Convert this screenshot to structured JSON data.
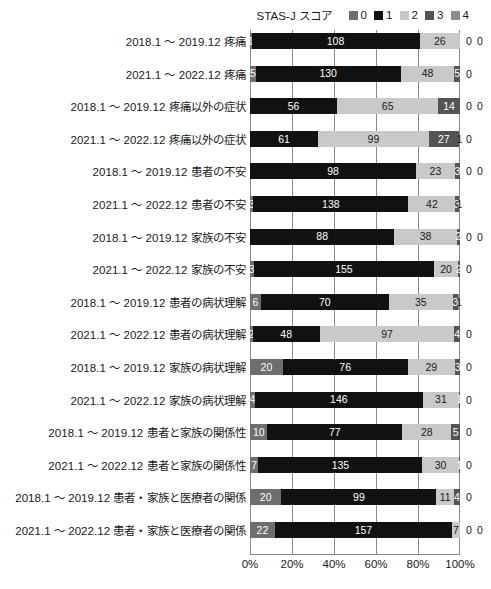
{
  "legend": {
    "title": "STAS-J スコア",
    "items": [
      {
        "label": "0",
        "color": "#6e6e6e"
      },
      {
        "label": "1",
        "color": "#111111"
      },
      {
        "label": "2",
        "color": "#c9c9c9"
      },
      {
        "label": "3",
        "color": "#545454"
      },
      {
        "label": "4",
        "color": "#8c8c8c"
      }
    ]
  },
  "xaxis": {
    "ticks": [
      "0%",
      "20%",
      "40%",
      "60%",
      "80%",
      "100%"
    ],
    "values": [
      0,
      20,
      40,
      60,
      80,
      100
    ]
  },
  "chart_data": {
    "type": "bar",
    "title": "",
    "subtitle": "",
    "xlabel": "",
    "ylabel": "",
    "orientation": "horizontal",
    "stacked": true,
    "normalized": true,
    "xlim": [
      0,
      100
    ],
    "grid": true,
    "legend_position": "top-right",
    "legend_title": "STAS-J スコア",
    "series": [
      {
        "name": "0",
        "color": "#6e6e6e",
        "values": [
          1,
          5,
          0,
          0,
          0,
          3,
          0,
          3,
          6,
          2,
          20,
          4,
          10,
          7,
          20,
          22
        ]
      },
      {
        "name": "1",
        "color": "#111111",
        "values": [
          108,
          130,
          56,
          61,
          98,
          138,
          88,
          155,
          70,
          48,
          76,
          146,
          77,
          135,
          99,
          157
        ]
      },
      {
        "name": "2",
        "color": "#c9c9c9",
        "values": [
          26,
          48,
          65,
          99,
          23,
          42,
          38,
          20,
          35,
          97,
          29,
          31,
          28,
          30,
          11,
          7
        ]
      },
      {
        "name": "3",
        "color": "#545454",
        "values": [
          0,
          5,
          14,
          27,
          3,
          3,
          2,
          2,
          3,
          4,
          3,
          1,
          5,
          1,
          4,
          0
        ]
      },
      {
        "name": "4",
        "color": "#8c8c8c",
        "values": [
          0,
          0,
          0,
          1,
          0,
          1,
          0,
          0,
          1,
          0,
          0,
          0,
          0,
          0,
          0,
          0
        ]
      }
    ],
    "categories": [
      "2018.1 ～ 2019.12 疼痛",
      "2021.1 ～ 2022.12 疼痛",
      "2018.1 ～ 2019.12 疼痛以外の症状",
      "2021.1 ～ 2022.12 疼痛以外の症状",
      "2018.1 ～ 2019.12 患者の不安",
      "2021.1 ～ 2022.12 患者の不安",
      "2018.1 ～ 2019.12 家族の不安",
      "2021.1 ～ 2022.12 家族の不安",
      "2018.1 ～ 2019.12 患者の病状理解",
      "2021.1 ～ 2022.12 患者の病状理解",
      "2018.1 ～ 2019.12 家族の病状理解",
      "2021.1 ～ 2022.12 家族の病状理解",
      "2018.1 ～ 2019.12 患者と家族の関係性",
      "2021.1 ～ 2022.12 患者と家族の関係性",
      "2018.1 ～ 2019.12 患者・家族と医療者の関係",
      "2021.1 ～ 2022.12 患者・家族と医療者の関係"
    ]
  }
}
